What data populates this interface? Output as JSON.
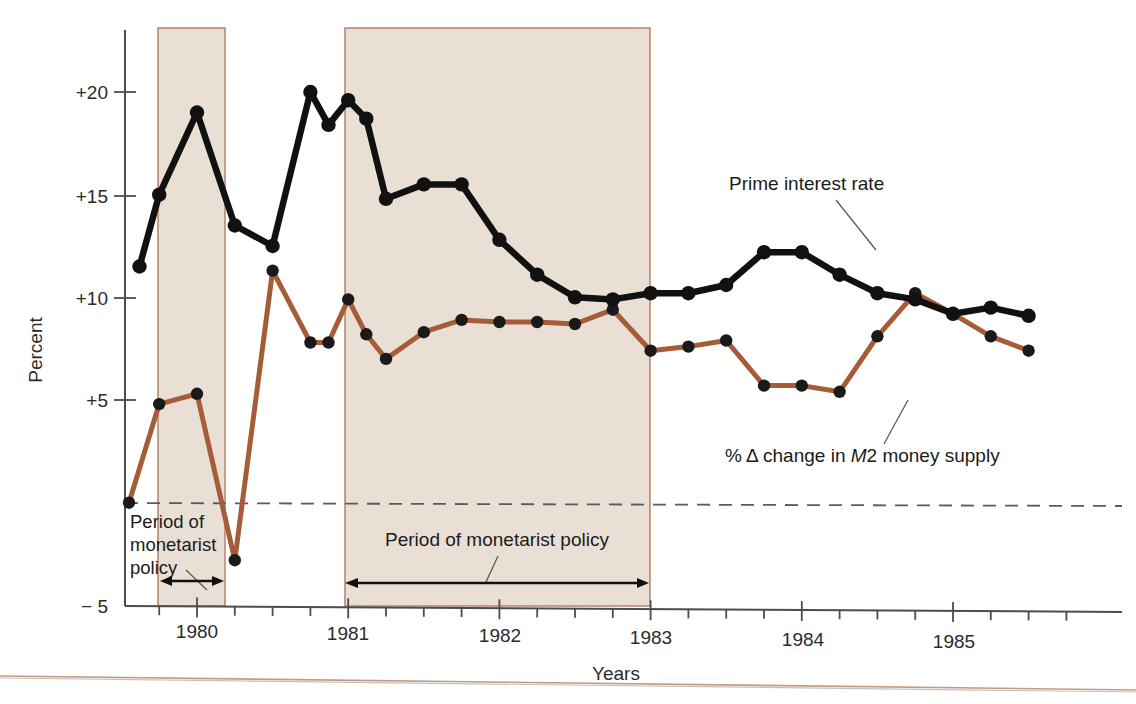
{
  "chart_data": {
    "type": "line",
    "xlabel": "Years",
    "ylabel": "Percent",
    "ylim": [
      -5,
      23
    ],
    "xlim": [
      1979.5,
      1985.75
    ],
    "yticks": [
      "+20",
      "+15",
      "+10",
      "+5",
      "-5"
    ],
    "ytick_values": [
      20,
      15,
      10,
      5,
      -5
    ],
    "xticks": [
      "1980",
      "1981",
      "1982",
      "1983",
      "1984",
      "1985"
    ],
    "xtick_values": [
      1980,
      1981,
      1982,
      1983,
      1984,
      1985
    ],
    "minor_tick_step_years": 0.25,
    "grid": false,
    "zero_reference_line": 0,
    "legend_position": "inline-annotation",
    "series": [
      {
        "name": "Prime interest rate",
        "color": "#111111",
        "x": [
          1979.62,
          1979.75,
          1980.0,
          1980.25,
          1980.5,
          1980.75,
          1980.87,
          1981.0,
          1981.12,
          1981.25,
          1981.5,
          1981.75,
          1982.0,
          1982.25,
          1982.5,
          1982.75,
          1983.0,
          1983.25,
          1983.5,
          1983.75,
          1984.0,
          1984.25,
          1984.5,
          1984.75,
          1985.0,
          1985.25,
          1985.5
        ],
        "values": [
          11.5,
          15.0,
          19.0,
          13.5,
          12.5,
          20.0,
          18.4,
          19.6,
          18.7,
          14.8,
          15.5,
          15.5,
          12.8,
          11.1,
          10.0,
          9.9,
          10.2,
          10.2,
          10.6,
          12.2,
          12.2,
          11.1,
          10.2,
          9.9,
          9.2,
          9.5,
          9.1
        ]
      },
      {
        "name": "% Δ change in M2 money supply",
        "color": "#a75c38",
        "x": [
          1979.55,
          1979.75,
          1980.0,
          1980.25,
          1980.5,
          1980.75,
          1980.87,
          1981.0,
          1981.12,
          1981.25,
          1981.5,
          1981.75,
          1982.0,
          1982.25,
          1982.5,
          1982.75,
          1983.0,
          1983.25,
          1983.5,
          1983.75,
          1984.0,
          1984.25,
          1984.5,
          1984.75,
          1985.0,
          1985.25,
          1985.5
        ],
        "values": [
          0.0,
          4.8,
          5.3,
          -2.8,
          11.3,
          7.8,
          7.8,
          9.9,
          8.2,
          7.0,
          8.3,
          8.9,
          8.8,
          8.8,
          8.7,
          9.4,
          7.4,
          7.6,
          7.9,
          5.7,
          5.7,
          5.4,
          8.1,
          10.2,
          9.2,
          8.1,
          7.4
        ]
      }
    ],
    "shaded_bands": [
      {
        "label": "Period of monetarist policy",
        "x_start": 1979.8,
        "x_end": 1980.25,
        "color": "#eadfd4"
      },
      {
        "label": "Period of monetarist policy",
        "x_start": 1981.0,
        "x_end": 1982.87,
        "color": "#eadfd4"
      }
    ],
    "annotations": [
      {
        "name": "prime-label",
        "text": "Prime interest rate"
      },
      {
        "name": "m2-label",
        "text": "% Δ change in M2 money supply"
      },
      {
        "name": "band1-label-line1",
        "text": "Period of"
      },
      {
        "name": "band1-label-line2",
        "text": "monetarist"
      },
      {
        "name": "band1-label-line3",
        "text": "policy"
      },
      {
        "name": "band2-label",
        "text": "Period of monetarist policy"
      }
    ],
    "colors": {
      "prime_line": "#111111",
      "m2_line": "#a75c38",
      "band_fill": "#eadfd4",
      "band_border": "#b07b63",
      "axis": "#4c4c4c",
      "background": "#ffffff"
    }
  },
  "labels": {
    "ylabel": "Percent",
    "xlabel": "Years",
    "ytick_20": "+20",
    "ytick_15": "+15",
    "ytick_10": "+10",
    "ytick_5": "+5",
    "ytick_m5": "− 5",
    "xtick_1980": "1980",
    "xtick_1981": "1981",
    "xtick_1982": "1982",
    "xtick_1983": "1983",
    "xtick_1984": "1984",
    "xtick_1985": "1985",
    "prime_label": "Prime interest rate",
    "m2_label_part1": "% Δ change in ",
    "m2_label_italic": "M",
    "m2_label_part2": "2 money supply",
    "band1_line1": "Period of",
    "band1_line2": "monetarist",
    "band1_line3": "policy",
    "band2_label": "Period of monetarist policy"
  }
}
